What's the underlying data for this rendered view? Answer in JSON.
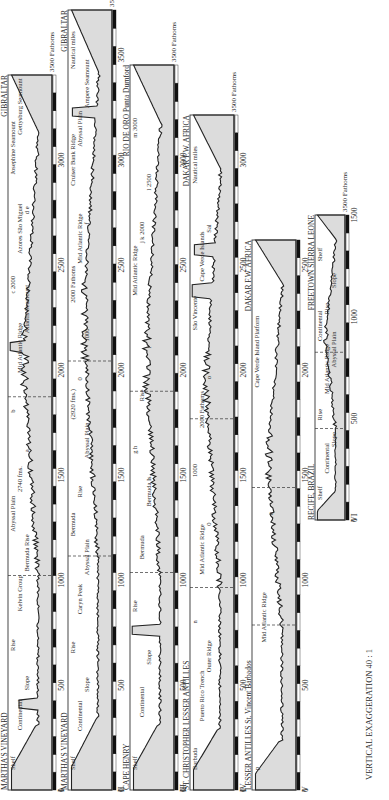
{
  "vertical_exaggeration": "VERTICAL EXAGGERATION 40 : 1",
  "units": {
    "depth": "3500 Fathoms",
    "distance": "Nautical miles"
  },
  "profiles": [
    {
      "id": "I",
      "start": "MARTHA'S VINEYARD",
      "end": "GIBRALTAR",
      "depth_label": "3500 Fathoms",
      "distance_ticks": [
        "0",
        "500",
        "1000",
        "1500",
        "2000",
        "2500",
        "3000"
      ],
      "feature_labels": [
        "Shelf",
        "Continental",
        "Slope",
        "Rise",
        "Kelvin Group",
        "Bermuda Rise",
        "Abyssal Plain",
        "2740 fms.",
        "a",
        "b",
        "Mid Atlantic Ridge",
        "Atlantis Seamount",
        "c 2000",
        "Azores São Miguel",
        "d e",
        "Josephine Seamount",
        "Gettysburg Seamount"
      ]
    },
    {
      "id": "II",
      "start": "MARTHA'S VINEYARD",
      "end": "GIBRALTAR",
      "depth_label": "3500 Fathoms",
      "distance_ticks": [
        "0",
        "500",
        "1000",
        "1500",
        "2000",
        "2500",
        "3000",
        "3500"
      ],
      "feature_labels": [
        "Shelf",
        "Continental",
        "Slope",
        "Rise",
        "Caryn Peak",
        "Abyssal Plain",
        "Bermuda",
        "Rise",
        "Abyssal Plain",
        "(2920 fms.)",
        "0",
        "1000",
        "2000 Fathoms",
        "Mid Atlantic Ridge",
        "f",
        "Cruiser Bank Ridge",
        "Abyssal Plain",
        "Ampere Seamount",
        "Nautical miles"
      ]
    },
    {
      "id": "III",
      "start": "CAPE HENRY",
      "end": "RIO DE ORO Punta Durnford",
      "depth_label": "3500 Fathoms",
      "distance_ticks": [
        "0",
        "500",
        "1000",
        "1500",
        "2000",
        "2500",
        "3000"
      ],
      "feature_labels": [
        "Shelf",
        "Continental",
        "Slope",
        "Rise",
        "Bermuda",
        "Bermuda Is.",
        "g h",
        "Rise",
        "i",
        "Mid Atlantic Ridge",
        "j k 2000",
        "l 2500",
        "m 3000"
      ]
    },
    {
      "id": "IV",
      "start": "ST. CHRISTOPHER LESSER ANTILLES",
      "end": "DAKAR F.W. AFRICA",
      "depth_label": "3500 Fathoms",
      "distance_ticks": [
        "0",
        "500",
        "1000",
        "1500",
        "2000",
        "2500",
        "3000"
      ],
      "feature_labels": [
        "Barbuda",
        "Puerto Rico Trench",
        "Outer Ridge",
        "n",
        "Mid Atlantic Ridge",
        "0",
        "1000",
        "2000 Fathoms",
        "o",
        "São Vincente",
        "Cape Verde Islands",
        "Sal",
        "Nautical miles"
      ]
    },
    {
      "id": "V",
      "start": "LESSER ANTILLES St. Vincent Barbados",
      "end": "DAKAR F.W. AFRICA",
      "depth_label": "",
      "distance_ticks": [
        "0",
        "500",
        "1000",
        "1500",
        "2000",
        "2500"
      ],
      "feature_labels": [
        "p",
        "Mid Atlantic Ridge",
        "q",
        "Cape Verde Island Platform"
      ]
    },
    {
      "id": "VI",
      "start": "RECIFE, BRAZIL",
      "end": "FREETOWN SIERRA LEONE",
      "depth_label": "3500 Fathoms",
      "distance_ticks": [
        "0",
        "500",
        "1000",
        "1500"
      ],
      "feature_labels": [
        "Shelf",
        "Continental",
        "Slope",
        "Rise",
        "Mid Atlantic Ridge",
        "Abyssal Plain",
        "Continental",
        "Rise",
        "Slope",
        "Shelf"
      ]
    }
  ]
}
